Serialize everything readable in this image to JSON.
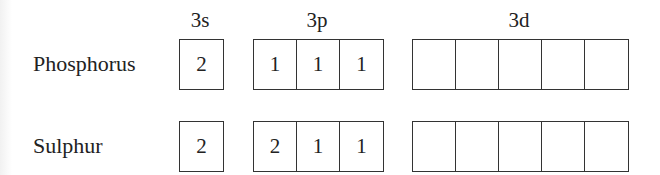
{
  "diagram": {
    "title": "",
    "subshell_headers": [
      {
        "label": "3s",
        "x": 200
      },
      {
        "label": "3p",
        "x": 317
      },
      {
        "label": "3d",
        "x": 519
      }
    ],
    "elements": [
      {
        "name": "Phosphorus",
        "row_top": 39,
        "label_top": 51,
        "orbitals": {
          "3s": [
            "2"
          ],
          "3p": [
            "1",
            "1",
            "1"
          ],
          "3d": [
            "",
            "",
            "",
            "",
            ""
          ]
        }
      },
      {
        "name": "Sulphur",
        "row_top": 121,
        "label_top": 133,
        "orbitals": {
          "3s": [
            "2"
          ],
          "3p": [
            "2",
            "1",
            "1"
          ],
          "3d": [
            "",
            "",
            "",
            "",
            ""
          ]
        }
      }
    ]
  }
}
